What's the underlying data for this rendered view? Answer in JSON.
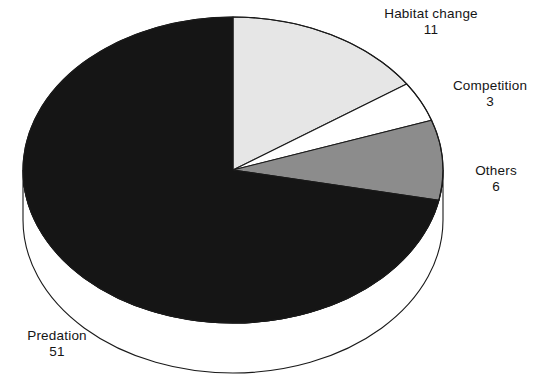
{
  "chart_data": {
    "type": "pie",
    "title": "",
    "subtitle": "",
    "xlabel": "",
    "ylabel": "",
    "total": 71,
    "start_angle_deg": 0,
    "direction": "clockwise",
    "three_d": true,
    "legend_position": "outside-labels",
    "grid": false,
    "categories": [
      "Habitat change",
      "Competition",
      "Others",
      "Predation"
    ],
    "values": [
      11,
      3,
      6,
      51
    ],
    "labels": [
      "Habitat change",
      "Competition",
      "Others",
      "Predation"
    ],
    "slices": [
      {
        "name": "Habitat change",
        "value": 11,
        "value_text": "11",
        "color": "#e6e6e6",
        "start_deg": 0,
        "end_deg": 55.77
      },
      {
        "name": "Competition",
        "value": 3,
        "value_text": "3",
        "color": "#ffffff",
        "start_deg": 55.77,
        "end_deg": 70.99
      },
      {
        "name": "Others",
        "value": 6,
        "value_text": "6",
        "color": "#8c8c8c",
        "start_deg": 70.99,
        "end_deg": 101.41
      },
      {
        "name": "Predation",
        "value": 51,
        "value_text": "51",
        "color": "#151515",
        "start_deg": 101.41,
        "end_deg": 360
      }
    ]
  },
  "labels": {
    "habitat_change": {
      "name": "Habitat change",
      "value": "11"
    },
    "competition": {
      "name": "Competition",
      "value": "3"
    },
    "others": {
      "name": "Others",
      "value": "6"
    },
    "predation": {
      "name": "Predation",
      "value": "51"
    }
  },
  "colors": {
    "habitat_change": "#e6e6e6",
    "competition": "#ffffff",
    "others": "#8c8c8c",
    "predation": "#151515",
    "outline": "#1a1a1a",
    "side_wall": "#ffffff",
    "background": "#ffffff",
    "text": "#151515"
  }
}
